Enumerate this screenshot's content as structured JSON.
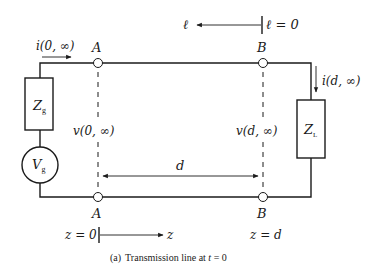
{
  "diagram": {
    "type": "circuit",
    "title": "Transmission line at t = 0",
    "caption": {
      "prefix": "(a)",
      "text": "Transmission line at ",
      "var": "t",
      "eq": " = 0"
    },
    "top_axis": {
      "direction_label": "ℓ",
      "origin_label": "ℓ = 0"
    },
    "bottom_axis": {
      "origin_label": "z = 0",
      "direction_label": "z",
      "end_label": "z = d"
    },
    "nodes": {
      "A_top": "A",
      "B_top": "B",
      "A_bottom": "A",
      "B_bottom": "B"
    },
    "components": {
      "source_impedance": {
        "main": "Z",
        "sub": "g"
      },
      "source_voltage": {
        "main": "V",
        "sub": "g"
      },
      "load_impedance": {
        "main": "Z",
        "sub": "L"
      }
    },
    "currents": {
      "input": "i(0, ∞)",
      "load": "i(d, ∞)"
    },
    "voltages": {
      "at_A": "v(0, ∞)",
      "at_B": "v(d, ∞)"
    },
    "length": {
      "label": "d"
    }
  }
}
